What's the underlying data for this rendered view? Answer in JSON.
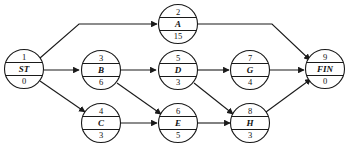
{
  "diagram": {
    "type": "directed-network",
    "colors": {
      "stroke": "#1a1a1a",
      "node_fill": "#ffffff",
      "background": "#ffffff",
      "text": "#111111"
    },
    "node_radius": 19.5,
    "nodes": [
      {
        "key": "ST",
        "id": "1",
        "label": "ST",
        "duration": "0",
        "cx": 24,
        "cy": 69
      },
      {
        "key": "A",
        "id": "2",
        "label": "A",
        "duration": "15",
        "cx": 178,
        "cy": 24
      },
      {
        "key": "B",
        "id": "3",
        "label": "B",
        "duration": "6",
        "cx": 101,
        "cy": 70
      },
      {
        "key": "C",
        "id": "4",
        "label": "C",
        "duration": "3",
        "cx": 101,
        "cy": 123
      },
      {
        "key": "D",
        "id": "5",
        "label": "D",
        "duration": "3",
        "cx": 178,
        "cy": 70
      },
      {
        "key": "E",
        "id": "6",
        "label": "E",
        "duration": "5",
        "cx": 178,
        "cy": 123
      },
      {
        "key": "G",
        "id": "7",
        "label": "G",
        "duration": "4",
        "cx": 250,
        "cy": 70
      },
      {
        "key": "H",
        "id": "8",
        "label": "H",
        "duration": "3",
        "cx": 250,
        "cy": 123
      },
      {
        "key": "FIN",
        "id": "9",
        "label": "FIN",
        "duration": "0",
        "cx": 325,
        "cy": 69
      }
    ],
    "edges": [
      {
        "from": "ST",
        "to": "A",
        "path": "M 40 58 L 79 24 L 157 24",
        "name": "edge-st-a"
      },
      {
        "from": "ST",
        "to": "B",
        "path": "M 44 70 L 79 70",
        "name": "edge-st-b"
      },
      {
        "from": "ST",
        "to": "C",
        "path": "M 40 81 L 85 112",
        "name": "edge-st-c"
      },
      {
        "from": "B",
        "to": "D",
        "path": "M 121 70 L 156 70",
        "name": "edge-b-d"
      },
      {
        "from": "B",
        "to": "E",
        "path": "M 117 83 L 161 114",
        "name": "edge-b-e"
      },
      {
        "from": "C",
        "to": "E",
        "path": "M 121 123 L 157 123",
        "name": "edge-c-e"
      },
      {
        "from": "D",
        "to": "G",
        "path": "M 198 70 L 229 70",
        "name": "edge-d-g"
      },
      {
        "from": "D",
        "to": "H",
        "path": "M 194 83 L 233 114",
        "name": "edge-d-h"
      },
      {
        "from": "E",
        "to": "H",
        "path": "M 198 123 L 230 123",
        "name": "edge-e-h"
      },
      {
        "from": "G",
        "to": "FIN",
        "path": "M 270 70 L 304 70",
        "name": "edge-g-fin"
      },
      {
        "from": "A",
        "to": "FIN",
        "path": "M 198 24 L 272 24 L 310 60",
        "name": "edge-a-fin"
      },
      {
        "from": "H",
        "to": "FIN",
        "path": "M 266 112 L 311 79",
        "name": "edge-h-fin"
      }
    ]
  }
}
